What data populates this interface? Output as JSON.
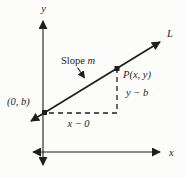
{
  "labels": {
    "axis_y": "y",
    "axis_x": "x",
    "line": "L",
    "slope_word": "Slope ",
    "slope_var": "m",
    "point_p": "P(x, y)",
    "rise": "y − b",
    "run": "x − 0",
    "intercept": "(0, b)"
  },
  "colors": {
    "ink": "#1e1e1e",
    "background": "#fcfcfa"
  }
}
